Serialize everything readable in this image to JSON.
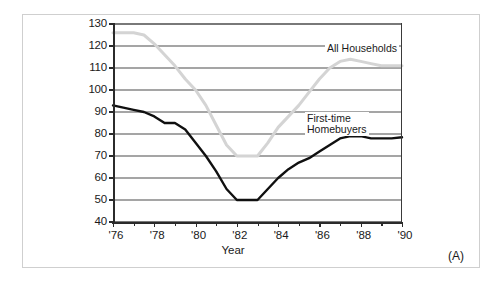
{
  "figure": {
    "panel_tag": "(A)",
    "xaxis_title": "Year",
    "series_labels": {
      "all_households": "All Households",
      "first_time": "First-time\nHomebuyers",
      "first_time_line1": "First-time",
      "first_time_line2": "Homebuyers"
    },
    "colors": {
      "all_households": "#d4d4d4",
      "first_time": "#101010",
      "grid": "#4d4d4d",
      "axis": "#2b2b2b",
      "frame": "#cfcfcf",
      "background": "#ffffff"
    }
  },
  "chart_data": {
    "type": "line",
    "title": "",
    "subtitle": "",
    "xlabel": "Year",
    "ylabel": "",
    "xlim": [
      1976,
      1990
    ],
    "ylim": [
      40,
      130
    ],
    "ytick_values": [
      130,
      120,
      110,
      100,
      90,
      80,
      70,
      60,
      50,
      40
    ],
    "ytick_labels": [
      "130",
      "120",
      "110",
      "100",
      "90",
      "80",
      "70",
      "60",
      "50",
      "40"
    ],
    "xtick_values": [
      1976,
      1978,
      1980,
      1982,
      1984,
      1986,
      1988,
      1990
    ],
    "xtick_labels": [
      "'76",
      "'78",
      "'80",
      "'82",
      "'84",
      "'86",
      "'88",
      "'90"
    ],
    "xtick_minor_values": [
      1977,
      1979,
      1981,
      1983,
      1985,
      1987,
      1989
    ],
    "grid": "horizontal",
    "legend_position": "inline-annotation",
    "annotations": [
      {
        "text": "All Households",
        "x": 1987.0,
        "y": 117
      },
      {
        "text": "First-time Homebuyers",
        "x": 1986.2,
        "y": 85
      },
      {
        "text": "(A)",
        "x": null,
        "y": null
      }
    ],
    "x": [
      1976,
      1976.5,
      1977,
      1977.5,
      1978,
      1978.5,
      1979,
      1979.5,
      1980,
      1980.5,
      1981,
      1981.5,
      1982,
      1982.5,
      1983,
      1983.5,
      1984,
      1984.5,
      1985,
      1985.5,
      1986,
      1986.5,
      1987,
      1987.5,
      1988,
      1988.5,
      1989,
      1989.5,
      1990
    ],
    "series": [
      {
        "name": "All Households",
        "color": "#d4d4d4",
        "values": [
          126,
          126,
          126,
          125,
          121,
          116,
          111,
          105,
          100,
          93,
          84,
          75,
          70,
          70,
          70,
          76,
          83,
          88,
          93,
          99,
          105,
          110,
          113,
          114,
          113,
          112,
          111,
          111,
          111
        ]
      },
      {
        "name": "First-time Homebuyers",
        "color": "#101010",
        "values": [
          93,
          92,
          91,
          90,
          88,
          85,
          85,
          82,
          76,
          70,
          63,
          55,
          50,
          50,
          50,
          55,
          60,
          64,
          67,
          69,
          72,
          75,
          78,
          79,
          79,
          78,
          78,
          78,
          78.5
        ]
      }
    ]
  }
}
